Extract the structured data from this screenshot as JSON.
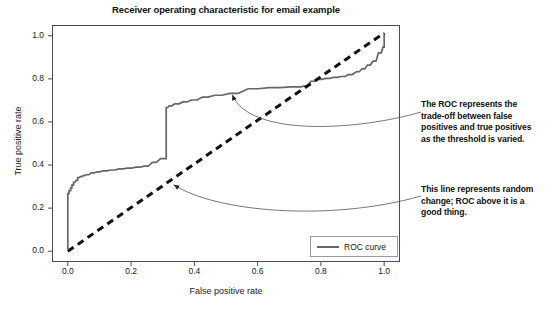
{
  "chart_data": {
    "type": "line",
    "title": "Receiver operating characteristic for email example",
    "xlabel": "False positive rate",
    "ylabel": "True positive rate",
    "xlim": [
      -0.05,
      1.05
    ],
    "ylim": [
      -0.05,
      1.05
    ],
    "xticks": [
      "0.0",
      "0.2",
      "0.4",
      "0.6",
      "0.8",
      "1.0"
    ],
    "xtick_values": [
      0.0,
      0.2,
      0.4,
      0.6,
      0.8,
      1.0
    ],
    "yticks": [
      "0.0",
      "0.2",
      "0.4",
      "0.6",
      "0.8",
      "1.0"
    ],
    "ytick_values": [
      0.0,
      0.2,
      0.4,
      0.6,
      0.8,
      1.0
    ],
    "grid": false,
    "legend_position": "lower right",
    "series": [
      {
        "name": "ROC curve",
        "style": "solid-step",
        "color": "#666666",
        "x": [
          0.0,
          0.0,
          0.004,
          0.004,
          0.009,
          0.009,
          0.013,
          0.013,
          0.018,
          0.018,
          0.022,
          0.026,
          0.031,
          0.031,
          0.035,
          0.04,
          0.044,
          0.048,
          0.053,
          0.057,
          0.066,
          0.075,
          0.083,
          0.092,
          0.101,
          0.11,
          0.123,
          0.136,
          0.149,
          0.162,
          0.175,
          0.188,
          0.202,
          0.215,
          0.228,
          0.241,
          0.254,
          0.267,
          0.28,
          0.293,
          0.302,
          0.307,
          0.311,
          0.311,
          0.316,
          0.32,
          0.329,
          0.338,
          0.351,
          0.364,
          0.377,
          0.39,
          0.408,
          0.425,
          0.443,
          0.465,
          0.487,
          0.513,
          0.539,
          0.57,
          0.601,
          0.636,
          0.671,
          0.706,
          0.737,
          0.75,
          0.759,
          0.768,
          0.781,
          0.794,
          0.803,
          0.816,
          0.829,
          0.838,
          0.851,
          0.864,
          0.877,
          0.886,
          0.899,
          0.912,
          0.921,
          0.93,
          0.939,
          0.947,
          0.956,
          0.965,
          0.974,
          0.982,
          0.991,
          0.996,
          1.0,
          1.0
        ],
        "y": [
          0.01,
          0.268,
          0.268,
          0.281,
          0.281,
          0.294,
          0.294,
          0.307,
          0.307,
          0.32,
          0.32,
          0.329,
          0.329,
          0.342,
          0.342,
          0.346,
          0.346,
          0.351,
          0.351,
          0.355,
          0.355,
          0.364,
          0.364,
          0.368,
          0.368,
          0.373,
          0.373,
          0.377,
          0.377,
          0.382,
          0.382,
          0.386,
          0.386,
          0.39,
          0.39,
          0.395,
          0.395,
          0.412,
          0.412,
          0.43,
          0.43,
          0.43,
          0.43,
          0.667,
          0.667,
          0.675,
          0.675,
          0.684,
          0.684,
          0.693,
          0.693,
          0.702,
          0.702,
          0.715,
          0.715,
          0.724,
          0.724,
          0.733,
          0.733,
          0.754,
          0.754,
          0.759,
          0.759,
          0.763,
          0.763,
          0.768,
          0.768,
          0.789,
          0.789,
          0.798,
          0.798,
          0.802,
          0.802,
          0.807,
          0.807,
          0.811,
          0.811,
          0.82,
          0.82,
          0.833,
          0.833,
          0.846,
          0.846,
          0.864,
          0.864,
          0.882,
          0.882,
          0.921,
          0.921,
          0.947,
          0.947,
          1.013
        ]
      },
      {
        "name": "chance-diagonal",
        "style": "dashed",
        "color": "#111111",
        "x": [
          0.0,
          1.0
        ],
        "y": [
          0.0,
          1.013
        ]
      }
    ],
    "annotations": [
      {
        "id": "roc-tradeoff",
        "text": "The ROC represents the trade-off between false positives and true positives as the threshold is varied.",
        "target": [
          0.52,
          0.745
        ]
      },
      {
        "id": "random-chance",
        "text": "This line represents random change; ROC above it is a good thing.",
        "target": [
          0.335,
          0.295
        ]
      }
    ]
  },
  "chart": {
    "title": "Receiver operating characteristic for email example",
    "xlabel": "False positive rate",
    "ylabel": "True positive rate",
    "xticks": [
      "0.0",
      "0.2",
      "0.4",
      "0.6",
      "0.8",
      "1.0"
    ],
    "yticks": [
      "0.0",
      "0.2",
      "0.4",
      "0.6",
      "0.8",
      "1.0"
    ],
    "legend": {
      "label": "ROC curve"
    }
  },
  "annotations": {
    "roc_tradeoff": "The ROC represents the trade-off between false positives and true positives as the threshold is varied.",
    "random_chance": "This line represents random change; ROC above it is a good thing."
  },
  "colors": {
    "roc_curve": "#666666",
    "chance_line": "#111111",
    "frame": "#4d4d4d",
    "leader_line": "#555555",
    "text": "#111111",
    "background": "#ffffff"
  }
}
